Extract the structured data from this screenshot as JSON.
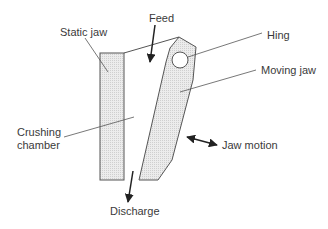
{
  "diagram": {
    "labels": {
      "feed": "Feed",
      "static_jaw": "Static jaw",
      "hinge": "Hing",
      "moving_jaw": "Moving jaw",
      "crushing_chamber_line1": "Crushing",
      "crushing_chamber_line2": "chamber",
      "jaw_motion": "Jaw motion",
      "discharge": "Discharge"
    },
    "colors": {
      "fill": "#e4e4e4",
      "stroke": "#555555",
      "text": "#3a3a3a"
    }
  }
}
